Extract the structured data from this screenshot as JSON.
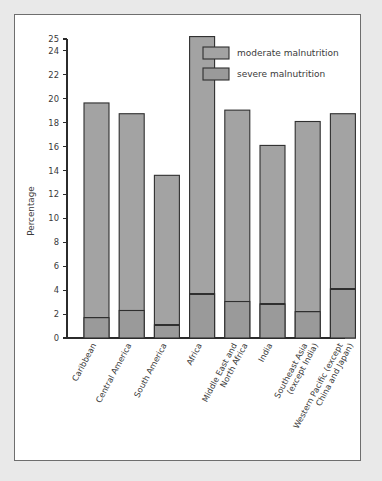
{
  "chart_data": {
    "type": "bar",
    "subtype": "stacked",
    "title": "",
    "xlabel": "",
    "ylabel": "Percentage",
    "ylim": [
      0,
      26
    ],
    "grid": false,
    "legend_position": "top-right",
    "ytick_labels": [
      "0",
      "2",
      "4",
      "6",
      "8",
      "10",
      "12",
      "14",
      "16",
      "18",
      "20",
      "22",
      "24",
      "25"
    ],
    "ytick_values": [
      0,
      2,
      4,
      6,
      8,
      10,
      12,
      14,
      16,
      18,
      20,
      22,
      24,
      25
    ],
    "categories": [
      "Caribbean",
      "Central America",
      "South America",
      "Africa",
      "Middle East and North Africa",
      "India",
      "Southeast Asia (except India)",
      "Western Pacific (except China and Japan)"
    ],
    "category_lines": [
      [
        "Caribbean"
      ],
      [
        "Central America"
      ],
      [
        "South America"
      ],
      [
        "Africa"
      ],
      [
        "Middle East and",
        "North Africa"
      ],
      [
        "India"
      ],
      [
        "Southeast Asia",
        "(except India)"
      ],
      [
        "Western Pacific (except",
        "China and Japan)"
      ]
    ],
    "series": [
      {
        "name": "severe malnutrition",
        "color": "#9a9a9a",
        "values": [
          1.7,
          2.3,
          1.1,
          3.7,
          3.05,
          2.85,
          2.2,
          4.1
        ]
      },
      {
        "name": "moderate malnutrition",
        "color": "#a3a3a3",
        "values": [
          17.95,
          16.45,
          12.5,
          21.5,
          16.0,
          13.25,
          15.9,
          14.65
        ]
      }
    ],
    "totals": [
      19.65,
      18.75,
      13.6,
      25.2,
      19.05,
      16.1,
      18.1,
      18.75
    ],
    "legend_entries": [
      {
        "label": "moderate malnutrition",
        "color": "#a3a3a3"
      },
      {
        "label": "severe malnutrition",
        "color": "#9a9a9a"
      }
    ],
    "colors": {
      "page_background": "#e9e9e9",
      "panel_background": "#ffffff",
      "panel_border": "#6e6e6e",
      "axis": "#2b2b2b",
      "bar_fill": "#9a9a9a",
      "bar_edge": "#2f2f2f",
      "text": "#3a3a3a"
    }
  }
}
